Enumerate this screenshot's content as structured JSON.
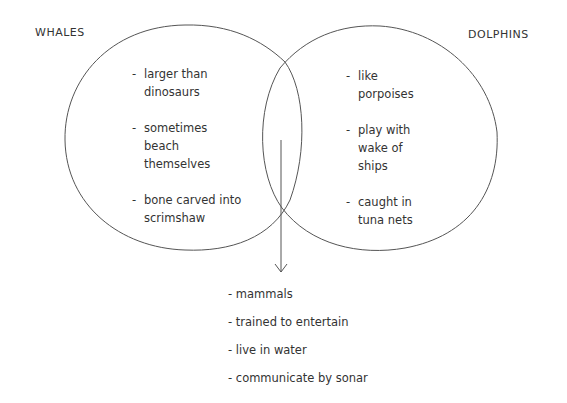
{
  "diagram": {
    "type": "venn",
    "sets": [
      {
        "name": "WHALES",
        "items": [
          "larger than dinosaurs",
          "sometimes beach themselves",
          "bone carved into scrimshaw"
        ]
      },
      {
        "name": "DOLPHINS",
        "items": [
          "like porpoises",
          "play with wake of ships",
          "caught in tuna nets"
        ]
      }
    ],
    "overlap": {
      "items": [
        "mammals",
        "trained to entertain",
        "live in water",
        "communicate by sonar"
      ]
    },
    "dash": "-",
    "stroke_color": "#555555"
  }
}
